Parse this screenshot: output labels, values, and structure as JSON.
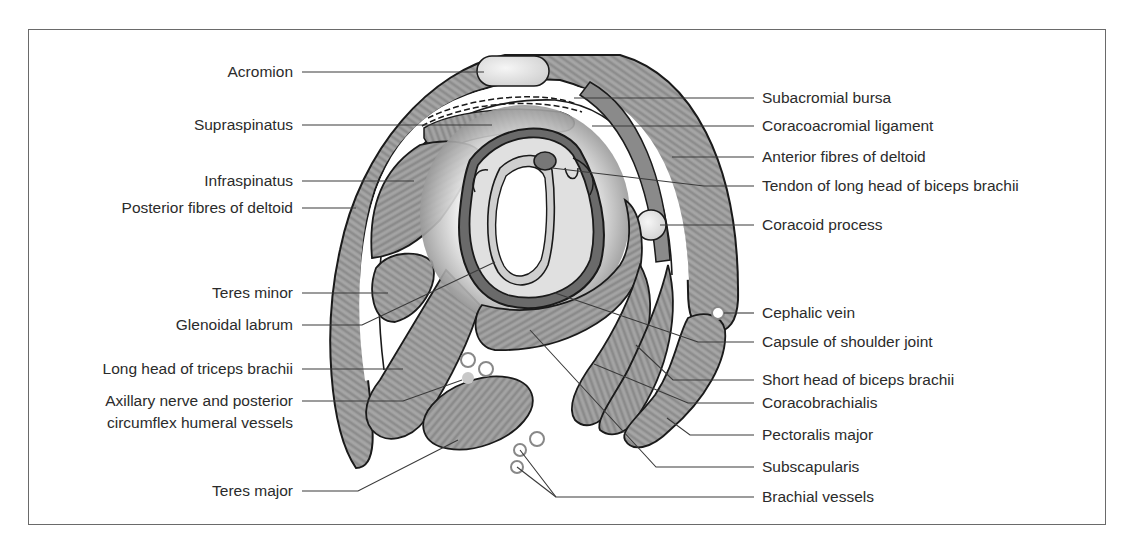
{
  "diagram": {
    "type": "anatomical-cross-section",
    "colors": {
      "muscle": "#9a9a9a",
      "outline": "#1a1a1a",
      "leader": "#3a3a3a",
      "bone": "#e4e4e4",
      "text": "#2b2b2b",
      "frame": "#6a6a6a"
    }
  },
  "labels_left": [
    {
      "id": "acromion",
      "text": "Acromion"
    },
    {
      "id": "supraspinatus",
      "text": "Supraspinatus"
    },
    {
      "id": "infraspinatus",
      "text": "Infraspinatus"
    },
    {
      "id": "posterior-deltoid",
      "text": "Posterior fibres of deltoid"
    },
    {
      "id": "teres-minor",
      "text": "Teres minor"
    },
    {
      "id": "glenoidal-labrum",
      "text": "Glenoidal labrum"
    },
    {
      "id": "long-head-triceps",
      "text": "Long head of triceps brachii"
    },
    {
      "id": "axillary-nerve",
      "text": "Axillary nerve and posterior",
      "text2": "circumflex humeral vessels"
    },
    {
      "id": "teres-major",
      "text": "Teres major"
    }
  ],
  "labels_right": [
    {
      "id": "subacromial-bursa",
      "text": "Subacromial bursa"
    },
    {
      "id": "coracoacromial-ligament",
      "text": "Coracoacromial ligament"
    },
    {
      "id": "anterior-deltoid",
      "text": "Anterior fibres of deltoid"
    },
    {
      "id": "tendon-biceps",
      "text": "Tendon of long head of biceps brachii"
    },
    {
      "id": "coracoid-process",
      "text": "Coracoid process"
    },
    {
      "id": "cephalic-vein",
      "text": "Cephalic vein"
    },
    {
      "id": "capsule",
      "text": "Capsule of shoulder joint"
    },
    {
      "id": "short-head-biceps",
      "text": "Short head of biceps brachii"
    },
    {
      "id": "coracobrachialis",
      "text": "Coracobrachialis"
    },
    {
      "id": "pectoralis-major",
      "text": "Pectoralis major"
    },
    {
      "id": "subscapularis",
      "text": "Subscapularis"
    },
    {
      "id": "brachial-vessels",
      "text": "Brachial vessels"
    }
  ]
}
